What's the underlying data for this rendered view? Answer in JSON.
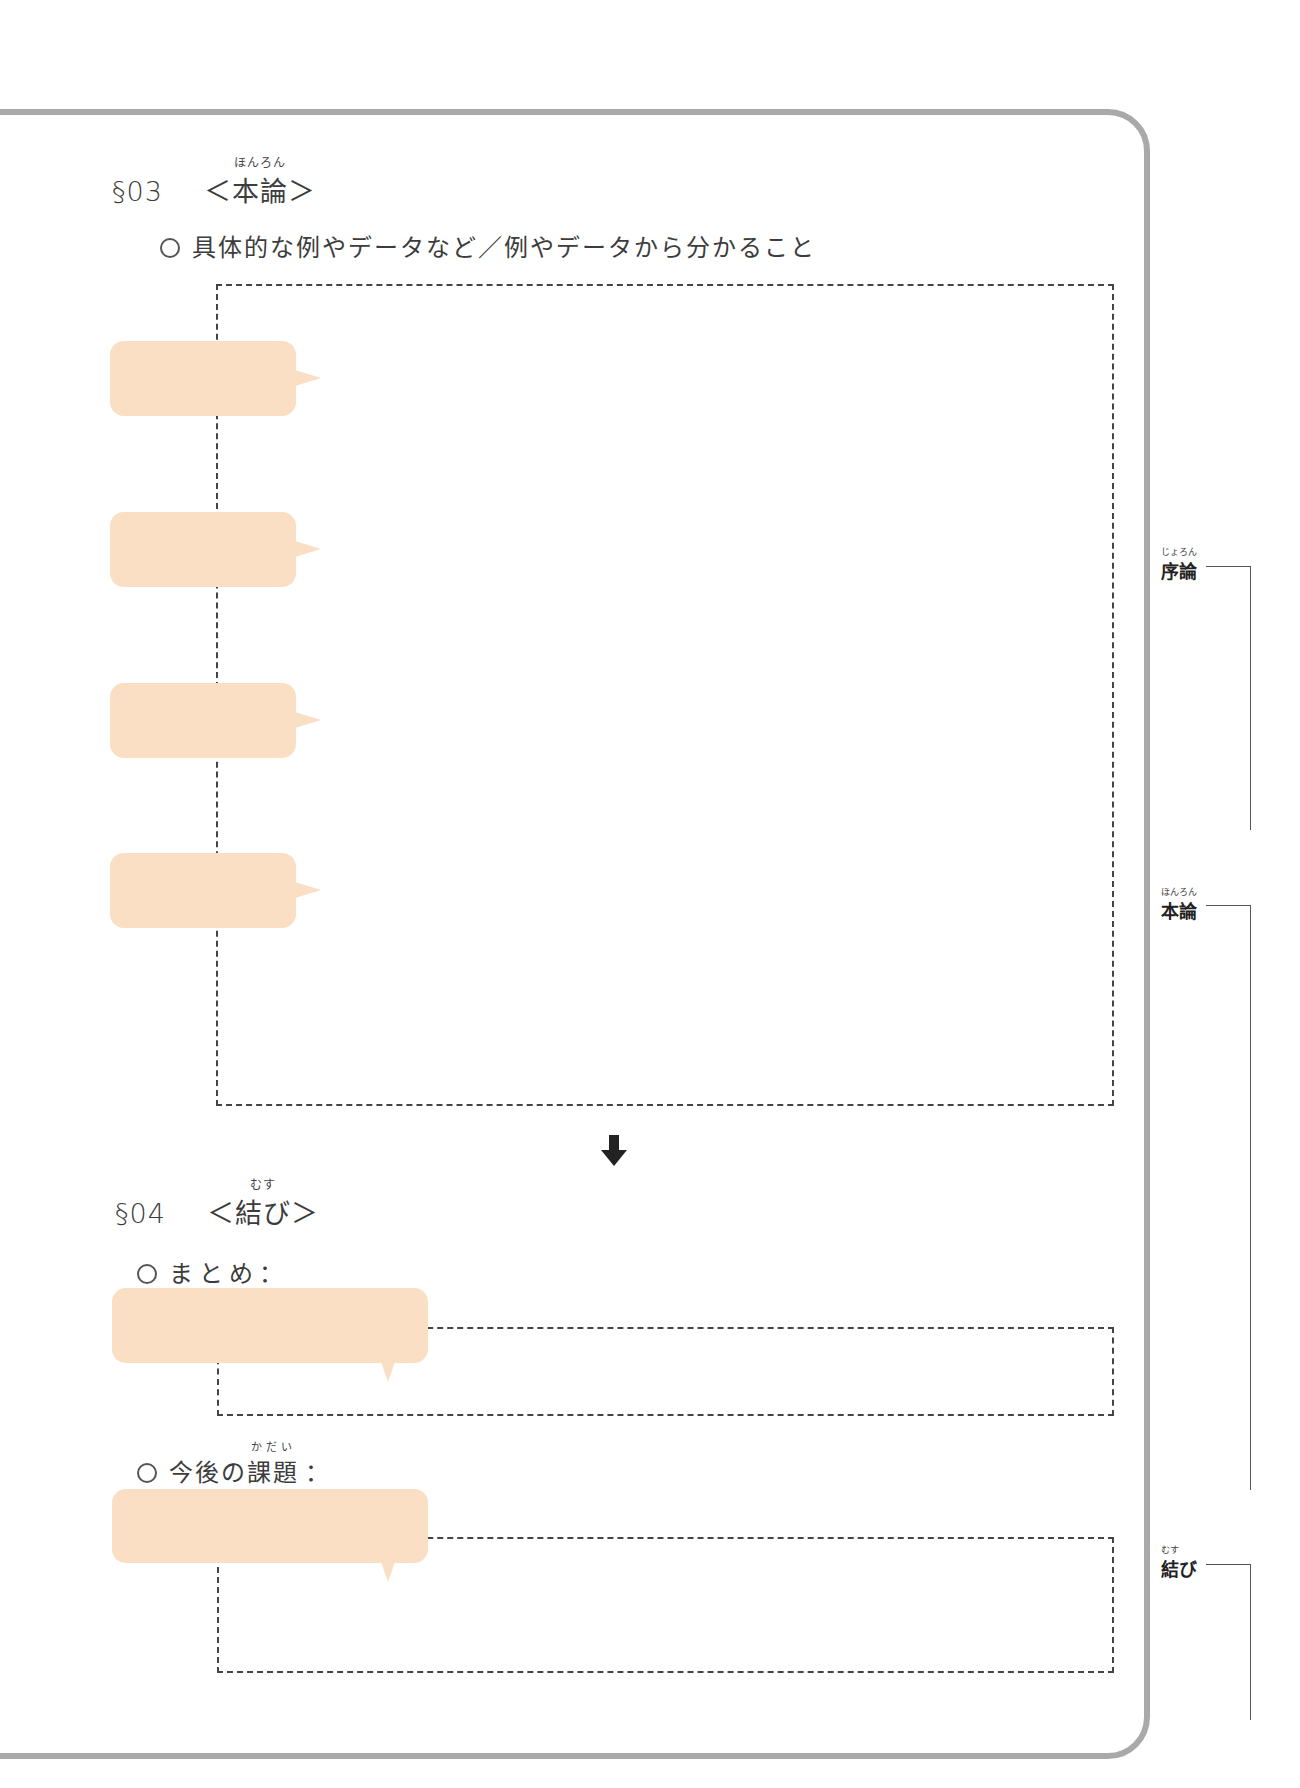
{
  "section03": {
    "number": "§03",
    "open": "＜",
    "title": "本論",
    "title_ruby": "ほんろん",
    "close": "＞",
    "prompt": "具体的な例やデータなど／例やデータから分かること",
    "bubbles": [
      {
        "text": ""
      },
      {
        "text": ""
      },
      {
        "text": ""
      },
      {
        "text": ""
      }
    ],
    "answer_box": ""
  },
  "section04": {
    "number": "§04",
    "open": "＜",
    "title": "結び",
    "title_ruby": "むす",
    "close": "＞",
    "items": [
      {
        "label_prefix": "まとめ",
        "label_ruby_target": "",
        "label_suffix": "：",
        "ruby": "",
        "bubble_text": "",
        "answer": ""
      },
      {
        "label_prefix": "今後の",
        "label_ruby_target": "課題",
        "label_suffix": "：",
        "ruby": "かだい",
        "bubble_text": "",
        "answer": ""
      }
    ]
  },
  "sidebar": {
    "labels": [
      {
        "text": "序論",
        "ruby": "じょろん"
      },
      {
        "text": "本論",
        "ruby": "ほんろん"
      },
      {
        "text": "結び",
        "ruby": "むす"
      }
    ]
  },
  "colors": {
    "bubble": "#fadfc4",
    "frame": "#a9a9a9",
    "dash": "#444444"
  }
}
